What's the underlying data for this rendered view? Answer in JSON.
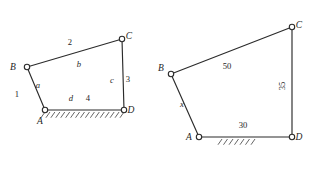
{
  "figure": {
    "background_color": "#ffffff",
    "stroke_color": "#2b2b2b",
    "text_color": "#1e1e1e"
  },
  "diagrams": [
    {
      "id": "left",
      "caption": "Symbolic four-bar linkage with link numbers and joint letters",
      "joints": [
        {
          "name": "A",
          "label": "A",
          "x": 45,
          "y": 110,
          "label_x": 40,
          "label_y": 124,
          "grounded": true
        },
        {
          "name": "B",
          "label": "B",
          "x": 27,
          "y": 67,
          "label_x": 13,
          "label_y": 70,
          "grounded": false
        },
        {
          "name": "C",
          "label": "C",
          "x": 122,
          "y": 39,
          "label_x": 129,
          "label_y": 39,
          "grounded": false
        },
        {
          "name": "D",
          "label": "D",
          "x": 124,
          "y": 110,
          "label_x": 131,
          "label_y": 113,
          "grounded": true
        }
      ],
      "links": [
        {
          "name": "link-AB",
          "from": "A",
          "to": "B",
          "number": "1",
          "symbol": "a",
          "number_x": 17,
          "number_y": 97,
          "symbol_x": 38,
          "symbol_y": 88
        },
        {
          "name": "link-BC",
          "from": "B",
          "to": "C",
          "number": "2",
          "symbol": "b",
          "number_x": 70,
          "number_y": 45,
          "symbol_x": 79,
          "symbol_y": 67
        },
        {
          "name": "link-CD",
          "from": "C",
          "to": "D",
          "number": "3",
          "symbol": "c",
          "number_x": 128,
          "number_y": 82,
          "symbol_x": 112,
          "symbol_y": 83
        },
        {
          "name": "link-AD",
          "from": "A",
          "to": "D",
          "number": "4",
          "symbol": "d",
          "number_x": 88,
          "number_y": 101,
          "symbol_x": 71,
          "symbol_y": 101
        }
      ],
      "ground": {
        "name": "ground-hatching",
        "x1": 45,
        "y1": 112,
        "x2": 124,
        "y2": 112,
        "tick_count": 17,
        "tick_length": 7,
        "tick_angle_deg": 55
      }
    },
    {
      "id": "right",
      "caption": "Dimensioned four-bar linkage with known lengths and unknown x",
      "joints": [
        {
          "name": "A",
          "label": "A",
          "x": 199,
          "y": 137,
          "label_x": 189,
          "label_y": 140,
          "grounded": true
        },
        {
          "name": "B",
          "label": "B",
          "x": 171,
          "y": 74,
          "label_x": 161,
          "label_y": 71,
          "grounded": false
        },
        {
          "name": "C",
          "label": "C",
          "x": 292,
          "y": 27,
          "label_x": 299,
          "label_y": 28,
          "grounded": false
        },
        {
          "name": "D",
          "label": "D",
          "x": 292,
          "y": 137,
          "label_x": 299,
          "label_y": 140,
          "grounded": true
        }
      ],
      "links": [
        {
          "name": "link-AB",
          "from": "A",
          "to": "B",
          "value": "x",
          "value_x": 182,
          "value_y": 107,
          "rotation": 0
        },
        {
          "name": "link-BC",
          "from": "B",
          "to": "C",
          "value": "50",
          "value_x": 227,
          "value_y": 69,
          "rotation": 0
        },
        {
          "name": "link-CD",
          "from": "C",
          "to": "D",
          "value": "35",
          "value_x": 285,
          "value_y": 86,
          "rotation": -90
        },
        {
          "name": "link-AD",
          "from": "A",
          "to": "D",
          "value": "30",
          "value_x": 243,
          "value_y": 128,
          "rotation": 0
        }
      ],
      "ground": {
        "name": "ground-hatching",
        "x1": 222,
        "y1": 139,
        "x2": 255,
        "y2": 139,
        "tick_count": 7,
        "tick_length": 7,
        "tick_angle_deg": 55
      }
    }
  ],
  "joint_radius": 2.7
}
